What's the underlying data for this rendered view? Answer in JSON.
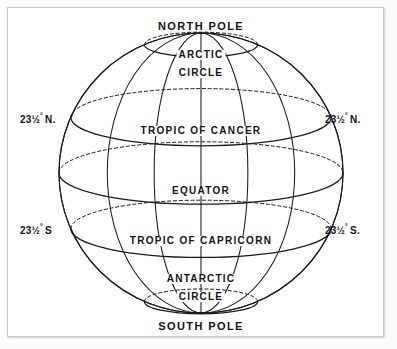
{
  "figure": {
    "type": "diagram"
  },
  "labels": {
    "north_pole": "NORTH POLE",
    "south_pole": "SOUTH POLE",
    "arctic_line1": "ARCTIC",
    "arctic_line2": "CIRCLE",
    "antarctic_line1": "ANTARCTIC",
    "antarctic_line2": "CIRCLE",
    "tropic_cancer": "TROPIC  OF  CANCER",
    "equator": "EQUATOR",
    "tropic_capricorn": "TROPIC  OF  CAPRICORN"
  },
  "degree_labels": {
    "cancer_left": {
      "number": "23",
      "fraction": "½",
      "degree": "°",
      "hemisphere": "N."
    },
    "cancer_right": {
      "number": "23",
      "fraction": "½",
      "degree": "°",
      "hemisphere": "N."
    },
    "capricorn_left": {
      "number": "23",
      "fraction": "½",
      "degree": "°",
      "hemisphere": "S"
    },
    "capricorn_right": {
      "number": "23",
      "fraction": "½",
      "degree": "°",
      "hemisphere": "S."
    }
  },
  "geometry": {
    "center_x": 200,
    "center_y": 172,
    "radius_x": 142,
    "radius_y": 140,
    "tilt_ry_factor": 0.22
  },
  "latitudes": [
    {
      "name": "arctic-circle",
      "degrees": 66.5,
      "style": "dashed-back-solid-front"
    },
    {
      "name": "tropic-of-cancer",
      "degrees": 23.5,
      "style": "dashed-back-solid-front"
    },
    {
      "name": "equator",
      "degrees": 0,
      "style": "dashed-back-solid-front"
    },
    {
      "name": "tropic-of-capricorn",
      "degrees": -23.5,
      "style": "dashed-back-solid-front"
    },
    {
      "name": "antarctic-circle",
      "degrees": -66.5,
      "style": "dashed-back-solid-front"
    }
  ],
  "meridians": [
    {
      "name": "meridian-left-outer",
      "offset": -1.0
    },
    {
      "name": "meridian-left-mid",
      "offset": -0.66
    },
    {
      "name": "meridian-left-inner",
      "offset": -0.33
    },
    {
      "name": "meridian-center",
      "offset": 0
    },
    {
      "name": "meridian-right-inner",
      "offset": 0.33
    },
    {
      "name": "meridian-right-mid",
      "offset": 0.66
    },
    {
      "name": "meridian-right-outer",
      "offset": 1.0
    }
  ],
  "colors": {
    "ink": "#1a1a1a",
    "paper": "#ffffff",
    "frame": "#c9c9c9",
    "page": "#fbfbfa"
  }
}
